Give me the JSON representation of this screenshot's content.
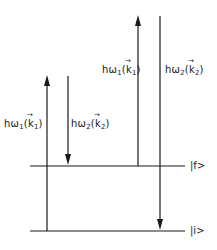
{
  "diagram": {
    "type": "energy-level-diagram",
    "levels": [
      {
        "id": "final",
        "label": "|f>",
        "y": 166
      },
      {
        "id": "initial",
        "label": "|i>",
        "y": 231
      }
    ],
    "transitions": [
      {
        "id": "t1",
        "label_prefix": "hω",
        "sub": "1",
        "k": "k",
        "ksub": "1",
        "direction": "up",
        "x": 47,
        "from_y": 231,
        "to_y": 75,
        "label_side": "left"
      },
      {
        "id": "t2",
        "label_prefix": "hω",
        "sub": "2",
        "k": "k",
        "ksub": "2",
        "direction": "down",
        "x": 68,
        "from_y": 76,
        "to_y": 166,
        "label_side": "right"
      },
      {
        "id": "t3",
        "label_prefix": "hω",
        "sub": "1",
        "k": "k",
        "ksub": "1",
        "direction": "up",
        "x": 138,
        "from_y": 166,
        "to_y": 15,
        "label_side": "left"
      },
      {
        "id": "t4",
        "label_prefix": "hω",
        "sub": "2",
        "k": "k",
        "ksub": "2",
        "direction": "down",
        "x": 160,
        "from_y": 16,
        "to_y": 231,
        "label_side": "right"
      }
    ],
    "line_color": "#1a1a1a"
  },
  "labels": {
    "t1": {
      "pre": "hω",
      "sub": "1",
      "k": "k",
      "ksub": "1"
    },
    "t2": {
      "pre": "hω",
      "sub": "2",
      "k": "k",
      "ksub": "2"
    },
    "t3": {
      "pre": "hω",
      "sub": "1",
      "k": "k",
      "ksub": "1"
    },
    "t4": {
      "pre": "hω",
      "sub": "2",
      "k": "k",
      "ksub": "2"
    },
    "state_f": "|f>",
    "state_i": "|i>",
    "paren_open": "(",
    "paren_close": ")"
  }
}
